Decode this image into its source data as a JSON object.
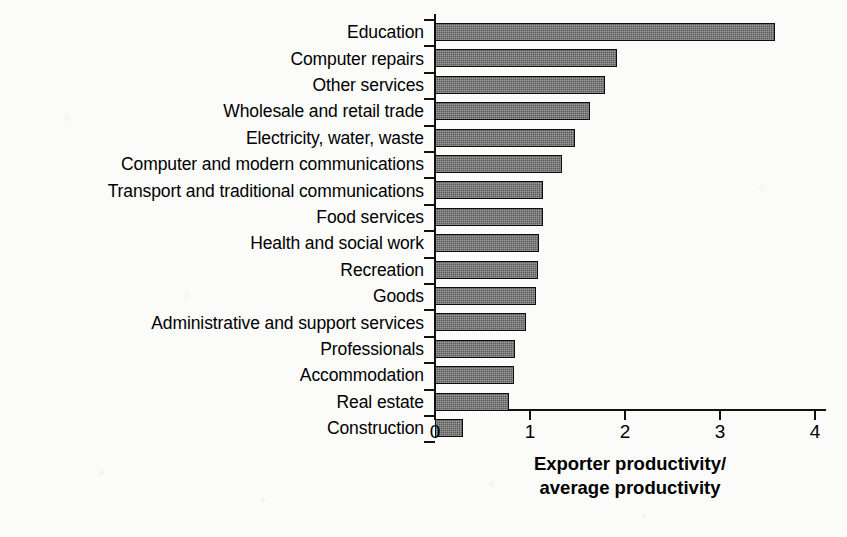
{
  "chart_data": {
    "type": "bar",
    "orientation": "horizontal",
    "title": "",
    "subtitle": "",
    "xlabel_lines": [
      "Exporter productivity/",
      "average productivity"
    ],
    "xlabel": "Exporter productivity/average productivity",
    "ylabel": "",
    "xlim": [
      0,
      4
    ],
    "xticks": [
      0,
      1,
      2,
      3,
      4
    ],
    "xtick_labels": [
      "0",
      "1",
      "2",
      "3",
      "4"
    ],
    "grid": false,
    "legend": false,
    "legend_position": "none",
    "bar_fill_color": "#5a5a5a",
    "bar_edge_color": "#0d0d0d",
    "background_color": "#fbfbfa",
    "categories": [
      "Education",
      "Computer repairs",
      "Other services",
      "Wholesale and retail trade",
      "Electricity, water, waste",
      "Computer and modern communications",
      "Transport and traditional communications",
      "Food services",
      "Health and social work",
      "Recreation",
      "Goods",
      "Administrative and support services",
      "Professionals",
      "Accommodation",
      "Real estate",
      "Construction"
    ],
    "values": [
      3.58,
      1.92,
      1.79,
      1.63,
      1.47,
      1.34,
      1.14,
      1.14,
      1.09,
      1.08,
      1.06,
      0.96,
      0.84,
      0.83,
      0.78,
      0.29
    ]
  }
}
